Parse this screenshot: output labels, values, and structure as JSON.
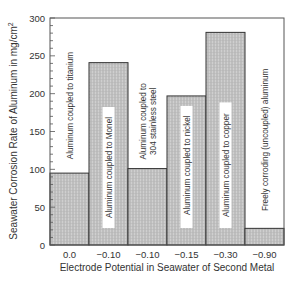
{
  "chart_data": {
    "type": "bar",
    "title": "",
    "xlabel": "Electrode Potential in Seawater of Second Metal",
    "ylabel": "Seawater Corrosion Rate of Aluminum in mg/cm²",
    "ylim": [
      0,
      300
    ],
    "yticks": [
      0,
      50,
      100,
      150,
      200,
      250,
      300
    ],
    "y_minor_step": 10,
    "grid": false,
    "legend": null,
    "categories": [
      "0.0",
      "−0.10",
      "−0.10",
      "−0.15",
      "−0.30",
      "−0.90"
    ],
    "bar_labels": [
      [
        "Aluminum coupled to titanium"
      ],
      [
        "Aluminum coupled to Monel"
      ],
      [
        "Aluminum coupled to",
        "304 stainless steel"
      ],
      [
        "Aluminum coupled to nickel"
      ],
      [
        "Aluminum coupled to copper"
      ],
      [
        "Freely corroding (uncoupled) aluminum"
      ]
    ],
    "values": [
      95,
      241,
      101,
      197,
      281,
      22
    ],
    "colors": {
      "bar_fill": "#c9c9c9",
      "bar_hatch": "#9a9a9a",
      "bar_edge": "#333333",
      "axis": "#444444",
      "label_box": "#ffffff"
    }
  }
}
